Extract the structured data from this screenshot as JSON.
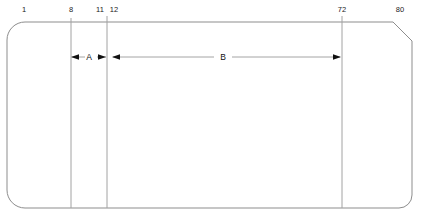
{
  "diagram": {
    "type": "engineering-outline-drawing",
    "canvas": {
      "width": 423,
      "height": 218
    },
    "colors": {
      "outline": "#8d8d8d",
      "divider": "#a2a2a2",
      "dimension_line": "#9a9a9a",
      "arrow": "#111111",
      "text": "#1a1a1a",
      "background": "#ffffff"
    },
    "station_labels": [
      {
        "name": "station-1",
        "text": "1",
        "x": 24,
        "y": 12
      },
      {
        "name": "station-8",
        "text": "8",
        "x": 71,
        "y": 12
      },
      {
        "name": "station-11",
        "text": "11",
        "x": 100,
        "y": 12
      },
      {
        "name": "station-12",
        "text": "12",
        "x": 114,
        "y": 12
      },
      {
        "name": "station-72",
        "text": "72",
        "x": 342,
        "y": 12
      },
      {
        "name": "station-80",
        "text": "80",
        "x": 400,
        "y": 12
      }
    ],
    "dimensions": [
      {
        "name": "dimension-a",
        "label": "A",
        "x_start": 71,
        "x_end": 108,
        "y": 57,
        "arrow_direction": "outward"
      },
      {
        "name": "dimension-b",
        "label": "B",
        "x_start": 112,
        "x_end": 340,
        "y": 57,
        "arrow_direction": "outward"
      }
    ],
    "vertical_dividers": [
      {
        "name": "divider-at-8",
        "x": 71
      },
      {
        "name": "divider-at-11",
        "x": 107
      },
      {
        "name": "divider-at-72",
        "x": 342
      }
    ],
    "outline_geometry": {
      "left": 7,
      "top": 22,
      "right": 412,
      "bottom": 208,
      "corner_radius_top_left": 18,
      "corner_radius_bottom_left": 18,
      "corner_radius_bottom_right": 13,
      "chamfer_top_right": 19
    }
  }
}
